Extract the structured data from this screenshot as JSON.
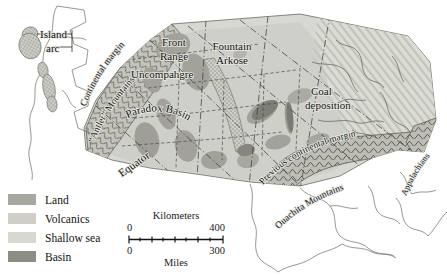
{
  "figure": {
    "kind": "paleogeographic-map",
    "region": "North America",
    "background_color": "#ffffff"
  },
  "map_labels": [
    {
      "id": "island-arc",
      "text_line1": "Island",
      "text_line2": "arc"
    },
    {
      "id": "continental-margin",
      "text": "Continental margin"
    },
    {
      "id": "antler-mountains",
      "text": "“Antler” Mountains"
    },
    {
      "id": "front-range",
      "text_line1": "Front",
      "text_line2": "Range"
    },
    {
      "id": "fountain-arkose",
      "text_line1": "Fountain",
      "text_line2": "Arkose"
    },
    {
      "id": "uncompahgre",
      "text": "Uncompahgre"
    },
    {
      "id": "paradox-basin",
      "text": "Paradox Basin"
    },
    {
      "id": "coal-deposition",
      "text_line1": "Coal",
      "text_line2": "deposition"
    },
    {
      "id": "previous-continental-margin",
      "text": "Previous continental margin"
    },
    {
      "id": "ouachita-mountains",
      "text": "Ouachita Mountains"
    },
    {
      "id": "appalachians",
      "text": "Appalachians"
    },
    {
      "id": "equator",
      "text": "Equator"
    }
  ],
  "labels": {
    "island_arc_1": "Island",
    "island_arc_2": "arc",
    "continental_margin": "Continental margin",
    "antler_mountains": "“Antler” Mountains",
    "front_range_1": "Front",
    "front_range_2": "Range",
    "fountain_arkose_1": "Fountain",
    "fountain_arkose_2": "Arkose",
    "uncompahgre": "Uncompahgre",
    "paradox_basin": "Paradox Basin",
    "coal_deposition_1": "Coal",
    "coal_deposition_2": "deposition",
    "previous_continental_margin": "Previous continental margin",
    "ouachita_mountains": "Ouachita Mountains",
    "appalachians": "Appalachians",
    "equator": "Equator"
  },
  "legend": {
    "items": [
      {
        "label": "Land",
        "swatch": "land",
        "color": "#a8a8a2"
      },
      {
        "label": "Volcanics",
        "swatch": "volcanics",
        "color": "#cfcfc8"
      },
      {
        "label": "Shallow sea",
        "swatch": "shallowsea",
        "color": "#d8d8d2"
      },
      {
        "label": "Basin",
        "swatch": "basin",
        "color": "#8d8d86"
      }
    ]
  },
  "scale_bar": {
    "top_caption": "Kilometers",
    "bottom_caption": "Miles",
    "km_min": "0",
    "km_max": "400",
    "mi_min": "0",
    "mi_max": "300"
  },
  "colors": {
    "shallow_sea": "#d8d8d2",
    "land": "#a8a8a2",
    "basin": "#8d8d86",
    "volcanics_fill": "#cfcfc8",
    "coal_hatch_bg": "#dedeD8",
    "outline": "#3a3a36",
    "coastline": "#55554f",
    "state_line": "#4a4a45",
    "dashdot": "#3f3f3a"
  }
}
